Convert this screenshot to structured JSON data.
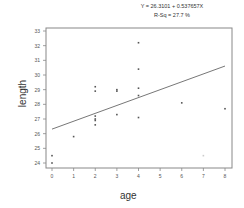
{
  "chart_data": {
    "type": "scatter",
    "title": "Y = 26.3101 + 0.537657X",
    "subtitle": "R-Sq = 27.7 %",
    "xlabel": "age",
    "ylabel": "length",
    "xlim": [
      0,
      8
    ],
    "ylim": [
      24,
      33
    ],
    "x_ticks": [
      0,
      1,
      2,
      3,
      4,
      5,
      6,
      7,
      8
    ],
    "y_ticks": [
      24,
      25,
      26,
      27,
      28,
      29,
      30,
      31,
      32,
      33
    ],
    "grid": false,
    "legend": null,
    "points": [
      {
        "x": 0,
        "y": 24.5
      },
      {
        "x": 0,
        "y": 24.0
      },
      {
        "x": 1,
        "y": 25.8
      },
      {
        "x": 2,
        "y": 29.2
      },
      {
        "x": 2,
        "y": 28.9
      },
      {
        "x": 2,
        "y": 27.2
      },
      {
        "x": 2,
        "y": 27.0
      },
      {
        "x": 2,
        "y": 26.9
      },
      {
        "x": 2,
        "y": 26.6
      },
      {
        "x": 3,
        "y": 29.0
      },
      {
        "x": 3,
        "y": 28.9
      },
      {
        "x": 3,
        "y": 27.3
      },
      {
        "x": 4,
        "y": 32.2
      },
      {
        "x": 4,
        "y": 30.4
      },
      {
        "x": 4,
        "y": 29.1
      },
      {
        "x": 4,
        "y": 28.6
      },
      {
        "x": 4,
        "y": 27.1
      },
      {
        "x": 6,
        "y": 28.1
      },
      {
        "x": 7,
        "y": 24.5
      },
      {
        "x": 8,
        "y": 27.7
      }
    ],
    "fit_line": {
      "intercept": 26.3101,
      "slope": 0.537657,
      "x_range": [
        0,
        8
      ]
    }
  },
  "header": {
    "equation": "Y = 26.3101 + 0.537657X",
    "rsq": "R-Sq = 27.7 %"
  },
  "axes": {
    "xlabel": "age",
    "ylabel": "length"
  }
}
